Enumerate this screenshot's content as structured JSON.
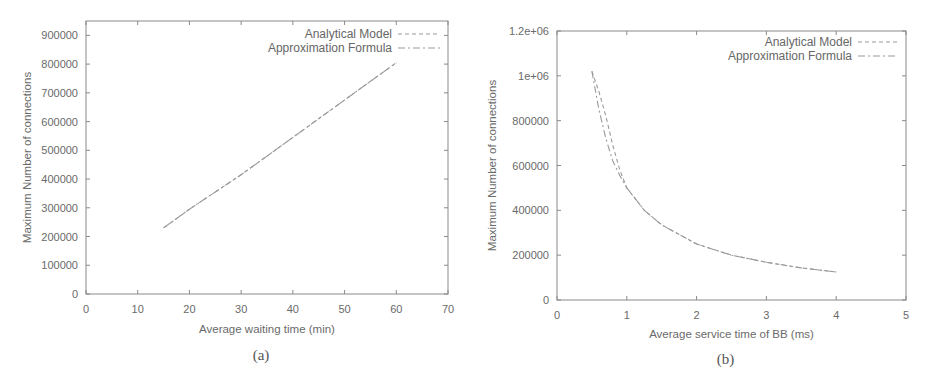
{
  "chart_data": [
    {
      "id": "a",
      "type": "line",
      "caption": "(a)",
      "title": "",
      "xlabel": "Average waiting time (min)",
      "ylabel": "Maximum Number of connections",
      "xlim": [
        0,
        70
      ],
      "ylim": [
        0,
        950000
      ],
      "xticks": [
        0,
        10,
        20,
        30,
        40,
        50,
        60,
        70
      ],
      "xtick_labels": [
        "0",
        "10",
        "20",
        "30",
        "40",
        "50",
        "60",
        "70"
      ],
      "yticks": [
        0,
        100000,
        200000,
        300000,
        400000,
        500000,
        600000,
        700000,
        800000,
        900000
      ],
      "ytick_labels": [
        "0",
        "100000",
        "200000",
        "300000",
        "400000",
        "500000",
        "600000",
        "700000",
        "800000",
        "900000"
      ],
      "grid": false,
      "legend_position": "upper right",
      "series": [
        {
          "name": "Analytical Model",
          "style": "dashed",
          "x": [
            15,
            20,
            25,
            30,
            35,
            40,
            45,
            50,
            55,
            60
          ],
          "y": [
            230000,
            295000,
            355000,
            415000,
            480000,
            545000,
            610000,
            675000,
            740000,
            805000
          ]
        },
        {
          "name": "Approximation Formula",
          "style": "dash-dot",
          "x": [
            15,
            20,
            25,
            30,
            35,
            40,
            45,
            50,
            55,
            60
          ],
          "y": [
            230000,
            295000,
            355000,
            415000,
            480000,
            545000,
            610000,
            675000,
            740000,
            805000
          ]
        }
      ]
    },
    {
      "id": "b",
      "type": "line",
      "caption": "(b)",
      "title": "",
      "xlabel": "Average service time of BB (ms)",
      "ylabel": "Maximum Number of connections",
      "xlim": [
        0,
        5
      ],
      "ylim": [
        0,
        1200000
      ],
      "xticks": [
        0,
        1,
        2,
        3,
        4,
        5
      ],
      "xtick_labels": [
        "0",
        "1",
        "2",
        "3",
        "4",
        "5"
      ],
      "yticks": [
        0,
        200000,
        400000,
        600000,
        800000,
        1000000,
        1200000
      ],
      "ytick_labels": [
        "0",
        "200000",
        "400000",
        "600000",
        "800000",
        "1e+06",
        "1.2e+06"
      ],
      "grid": false,
      "legend_position": "upper right",
      "series": [
        {
          "name": "Analytical Model",
          "style": "dashed",
          "x": [
            0.5,
            0.6,
            0.7,
            0.8,
            0.9,
            1.0,
            1.25,
            1.5,
            2.0,
            2.5,
            3.0,
            3.5,
            4.0
          ],
          "y": [
            1020000,
            930000,
            820000,
            690000,
            580000,
            500000,
            400000,
            335000,
            250000,
            200000,
            168000,
            143000,
            125000
          ]
        },
        {
          "name": "Approximation Formula",
          "style": "dash-dot",
          "x": [
            0.5,
            0.6,
            0.7,
            0.8,
            0.9,
            1.0,
            1.25,
            1.5,
            2.0,
            2.5,
            3.0,
            3.5,
            4.0
          ],
          "y": [
            1020000,
            850000,
            720000,
            620000,
            555000,
            500000,
            400000,
            335000,
            250000,
            200000,
            168000,
            143000,
            125000
          ]
        }
      ]
    }
  ],
  "figure": {
    "panels": [
      {
        "caption": "(a)",
        "legend": [
          "Analytical Model",
          "Approximation Formula"
        ]
      },
      {
        "caption": "(b)",
        "legend": [
          "Analytical Model",
          "Approximation Formula"
        ]
      }
    ],
    "colors": {
      "axis": "#8a8a8a",
      "line": "#9a9a9a",
      "text": "#666666",
      "background": "#ffffff"
    }
  }
}
